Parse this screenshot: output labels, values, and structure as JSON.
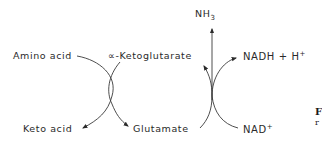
{
  "diagram": {
    "type": "coupled reaction diagram",
    "left_reaction": {
      "name": "transamination",
      "substrate_in_left": "Amino acid",
      "substrate_in_right": "α-Ketoglutarate",
      "product_out_left": "Keto acid",
      "product_out_right": "Glutamate"
    },
    "right_reaction": {
      "name": "oxidative deamination",
      "product_top": "NH3",
      "cofactor_out": "NADH + H+",
      "cofactor_in": "NAD+",
      "product_back": "α-Ketoglutarate",
      "substrate_in": "Glutamate"
    }
  },
  "labels": {
    "amino_acid": "Amino acid",
    "alpha_ketoglutarate": "∝-Ketoglutarate",
    "keto_acid": "Keto acid",
    "glutamate": "Glutamate",
    "nh3_main": "NH",
    "nh3_sub": "3",
    "nadh_main": "NADH + H",
    "nadh_sup": "+",
    "nad_main": "NAD",
    "nad_sup": "+"
  },
  "caption_fragment": {
    "line1": "F",
    "line2": "r"
  },
  "colors": {
    "line": "#3a3a3a",
    "text": "#2a2a2a",
    "background": "#ffffff"
  }
}
